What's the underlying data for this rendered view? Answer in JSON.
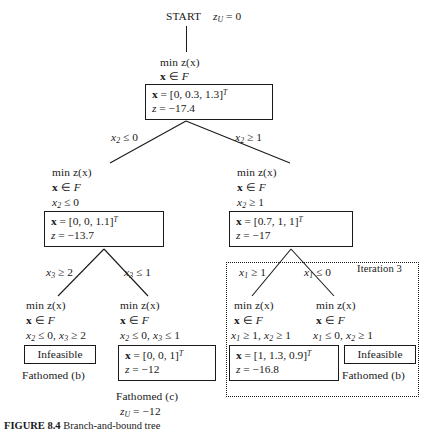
{
  "figure": {
    "caption_label": "FIGURE 8.4",
    "caption_text": "Branch-and-bound tree"
  },
  "root": {
    "start_label": "START",
    "bound_label": "z",
    "bound_sub": "U",
    "bound_value": "= 0",
    "objective": "min z(x)",
    "membership_x": "x",
    "membership_rel": "∈",
    "membership_set": "F",
    "solution_x_label": "x",
    "solution_x_value": "= [0, 0.3, 1.3]",
    "solution_x_sup": "T",
    "solution_z_label": "z",
    "solution_z_value": "= −17.4"
  },
  "branches_level1": {
    "left_label": "x",
    "left_sub": "2",
    "left_rel": "≤ 0",
    "right_label": "x",
    "right_sub": "2",
    "right_rel": "≥ 1"
  },
  "node_left": {
    "objective": "min z(x)",
    "membership_x": "x",
    "membership_rel": "∈",
    "membership_set": "F",
    "constraint_var": "x",
    "constraint_sub": "2",
    "constraint_rel": "≤ 0",
    "solution_x_label": "x",
    "solution_x_value": "= [0, 0, 1.1]",
    "solution_x_sup": "T",
    "solution_z_label": "z",
    "solution_z_value": "= −13.7"
  },
  "node_right": {
    "objective": "min z(x)",
    "membership_x": "x",
    "membership_rel": "∈",
    "membership_set": "F",
    "constraint_var": "x",
    "constraint_sub": "2",
    "constraint_rel": "≥ 1",
    "solution_x_label": "x",
    "solution_x_value": "= [0.7, 1, 1]",
    "solution_x_sup": "T",
    "solution_z_label": "z",
    "solution_z_value": "= −17"
  },
  "branches_level2_left": {
    "left_label": "x",
    "left_sub": "3",
    "left_rel": "≥ 2",
    "right_label": "x",
    "right_sub": "3",
    "right_rel": "≤ 1"
  },
  "branches_level2_right": {
    "left_label": "x",
    "left_sub": "1",
    "left_rel": "≥ 1",
    "right_label": "x",
    "right_sub": "1",
    "right_rel": "≤ 0",
    "iteration_label": "Iteration 3"
  },
  "leaf1": {
    "objective": "min z(x)",
    "membership_x": "x",
    "membership_rel": "∈",
    "membership_set": "F",
    "c1_var": "x",
    "c1_sub": "2",
    "c1_rel": "≤ 0,",
    "c2_var": "x",
    "c2_sub": "3",
    "c2_rel": "≥ 2",
    "result": "Infeasible",
    "fathomed": "Fathomed (b)"
  },
  "leaf2": {
    "objective": "min z(x)",
    "membership_x": "x",
    "membership_rel": "∈",
    "membership_set": "F",
    "c1_var": "x",
    "c1_sub": "2",
    "c1_rel": "≤ 0,",
    "c2_var": "x",
    "c2_sub": "3",
    "c2_rel": "≤ 1",
    "solution_x_label": "x",
    "solution_x_value": "= [0, 0, 1]",
    "solution_x_sup": "T",
    "solution_z_label": "z",
    "solution_z_value": "= −12",
    "fathomed": "Fathomed (c)",
    "bound_label": "z",
    "bound_sub": "U",
    "bound_value": "= −12"
  },
  "leaf3": {
    "objective": "min z(x)",
    "membership_x": "x",
    "membership_rel": "∈",
    "membership_set": "F",
    "c1_var": "x",
    "c1_sub": "1",
    "c1_rel": "≥ 1,",
    "c2_var": "x",
    "c2_sub": "2",
    "c2_rel": "≥ 1",
    "solution_x_label": "x",
    "solution_x_value": "= [1, 1.3, 0.9]",
    "solution_x_sup": "T",
    "solution_z_label": "z",
    "solution_z_value": "= −16.8"
  },
  "leaf4": {
    "objective": "min z(x)",
    "membership_x": "x",
    "membership_rel": "∈",
    "membership_set": "F",
    "c1_var": "x",
    "c1_sub": "1",
    "c1_rel": "≤ 0,",
    "c2_var": "x",
    "c2_sub": "2",
    "c2_rel": "≥ 1",
    "result": "Infeasible",
    "fathomed": "Fathomed (b)"
  }
}
